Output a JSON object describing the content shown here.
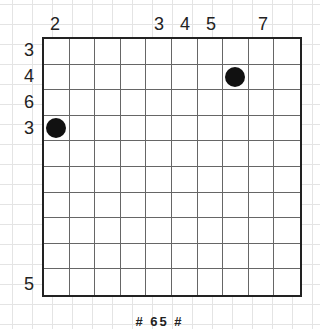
{
  "puzzle": {
    "rows": 10,
    "cols": 10,
    "column_clues": [
      "2",
      "",
      "",
      "",
      "3",
      "4",
      "5",
      "",
      "7",
      ""
    ],
    "row_clues": [
      "3",
      "4",
      "6",
      "3",
      "",
      "",
      "",
      "",
      "",
      "5"
    ],
    "stones": [
      {
        "row": 2,
        "col": 8,
        "color": "#111111"
      },
      {
        "row": 4,
        "col": 1,
        "color": "#111111"
      }
    ],
    "caption": "# 65 #"
  },
  "colors": {
    "grid_line": "#666666",
    "border": "#222222",
    "stone": "#111111",
    "background_grid": "#e4e4e4"
  }
}
